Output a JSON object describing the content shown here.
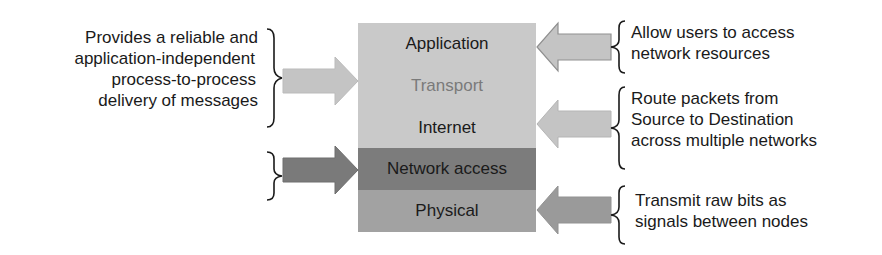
{
  "diagram": {
    "type": "protocol-stack",
    "layers": [
      {
        "label": "Application",
        "fill": "#c9c9c9",
        "text_color": "#1a1a1a"
      },
      {
        "label": "Transport",
        "fill": "#c9c9c9",
        "text_color": "#7a7a7a"
      },
      {
        "label": "Internet",
        "fill": "#c9c9c9",
        "text_color": "#1a1a1a"
      },
      {
        "label": "Network access",
        "fill": "#7c7c7c",
        "text_color": "#1a1a1a"
      },
      {
        "label": "Physical",
        "fill": "#a2a2a2",
        "text_color": "#1a1a1a"
      }
    ],
    "left_annotations": [
      {
        "text_lines": [
          "Provides a reliable and",
          "application-independent",
          "process-to-process",
          "delivery of messages"
        ],
        "target_layer": "Transport",
        "arrow_fill": "#c4c4c4"
      },
      {
        "text_lines": [],
        "target_layer": "Network access",
        "arrow_fill": "#7a7a7a"
      }
    ],
    "right_annotations": [
      {
        "text_lines": [
          "Allow users to access",
          "network resources"
        ],
        "target_layer": "Application",
        "arrow_fill": "#c4c4c4"
      },
      {
        "text_lines": [
          "Route packets from",
          "Source to Destination",
          "across multiple networks"
        ],
        "target_layer": "Internet",
        "arrow_fill": "#c4c4c4"
      },
      {
        "text_lines": [
          "Transmit raw bits as",
          "signals between nodes"
        ],
        "target_layer": "Physical",
        "arrow_fill": "#9a9a9a"
      }
    ]
  }
}
